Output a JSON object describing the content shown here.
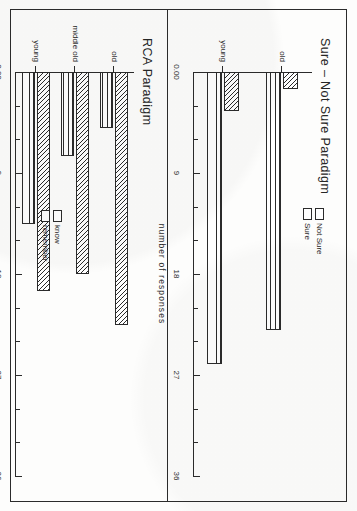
{
  "figure": {
    "axis_title": "number of responses",
    "tick_labels": [
      "0.00",
      "9",
      "18",
      "27",
      "36"
    ],
    "panels": [
      {
        "id": "sure-not-sure",
        "title": "Sure – Not Sure Paradigm",
        "legend": [
          {
            "label": "Not Sure",
            "pattern": "hatch"
          },
          {
            "label": "Sure",
            "pattern": "lines"
          }
        ],
        "categories": [
          "young",
          "old"
        ]
      },
      {
        "id": "rca",
        "title": "RCA Paradigm",
        "legend": [
          {
            "label": "know",
            "pattern": "hatch"
          },
          {
            "label": "remember",
            "pattern": "lines"
          }
        ],
        "categories": [
          "young",
          "middle old",
          "old"
        ]
      }
    ]
  },
  "chart_data": [
    {
      "type": "bar",
      "title": "Sure – Not Sure Paradigm",
      "orientation": "horizontal",
      "categories": [
        "young",
        "old"
      ],
      "series": [
        {
          "name": "Sure",
          "values": [
            26.0,
            23.0
          ]
        },
        {
          "name": "Not Sure",
          "values": [
            3.5,
            1.5
          ]
        }
      ],
      "xlabel": "number of responses",
      "ylabel": "",
      "xlim": [
        0,
        36
      ],
      "xticks": [
        0,
        9,
        18,
        27,
        36
      ],
      "xtick_labels": [
        "0.00",
        "9",
        "18",
        "27",
        "36"
      ],
      "grid": false,
      "legend_position": "upper-right"
    },
    {
      "type": "bar",
      "title": "RCA Paradigm",
      "orientation": "horizontal",
      "categories": [
        "young",
        "middle old",
        "old"
      ],
      "series": [
        {
          "name": "remember",
          "values": [
            13.5,
            7.5,
            5.0
          ]
        },
        {
          "name": "know",
          "values": [
            19.5,
            18.0,
            22.5
          ]
        }
      ],
      "xlabel": "number of responses",
      "ylabel": "",
      "xlim": [
        0,
        36
      ],
      "xticks": [
        0,
        9,
        18,
        27,
        36
      ],
      "xtick_labels": [
        "0.00",
        "9",
        "18",
        "27",
        "36"
      ],
      "grid": false,
      "legend_position": "upper-right"
    }
  ]
}
